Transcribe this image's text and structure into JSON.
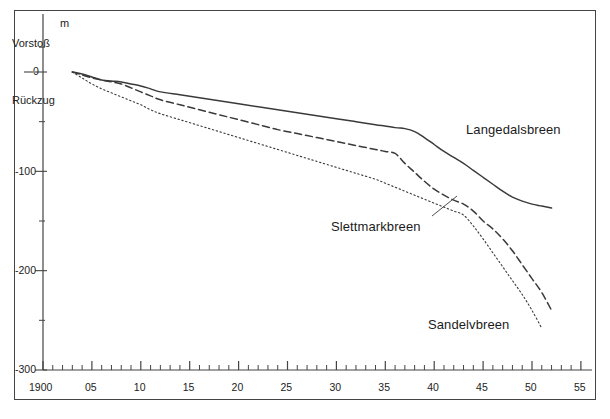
{
  "figure": {
    "unit_label": "m",
    "advance_label": "Vorstoß",
    "retreat_label": "Rückzug",
    "background_color": "#ffffff",
    "line_color": "#3a3a3a",
    "frame_color": "#444444"
  },
  "chart_data": {
    "type": "line",
    "title": "",
    "subtitle": "",
    "xlabel": "",
    "ylabel": "m",
    "axis_notes": {
      "positive_direction": "Vorstoß",
      "negative_direction": "Rückzug"
    },
    "xlim": [
      1900,
      1955
    ],
    "ylim": [
      -300,
      30
    ],
    "grid": false,
    "legend": "inline-labels",
    "x_tick_labels": [
      "1900",
      "05",
      "10",
      "15",
      "20",
      "25",
      "30",
      "35",
      "40",
      "45",
      "50",
      "55"
    ],
    "x_tick_values": [
      1900,
      1905,
      1910,
      1915,
      1920,
      1925,
      1930,
      1935,
      1940,
      1945,
      1950,
      1955
    ],
    "x_minor_tick_interval": 1,
    "y_tick_labels": [
      "0",
      "-100",
      "-200",
      "-300"
    ],
    "y_tick_values": [
      0,
      -100,
      -200,
      -300
    ],
    "y_minor_tick_values": [
      -50,
      -150,
      -250,
      25
    ],
    "series": [
      {
        "name": "Langedalsbreen",
        "style": "solid",
        "label_position": {
          "x": 466,
          "y": 122
        },
        "x": [
          1903,
          1904,
          1905,
          1906,
          1907,
          1908,
          1909,
          1910,
          1911,
          1912,
          1914,
          1916,
          1918,
          1920,
          1922,
          1924,
          1926,
          1928,
          1930,
          1932,
          1934,
          1936,
          1937,
          1938,
          1939,
          1940,
          1941,
          1942,
          1943,
          1944,
          1945,
          1946,
          1947,
          1948,
          1949,
          1950,
          1951,
          1952
        ],
        "y": [
          0,
          -2,
          -5,
          -8,
          -9,
          -10,
          -12,
          -14,
          -17,
          -20,
          -23,
          -26,
          -29,
          -32,
          -35,
          -38,
          -41,
          -44,
          -47,
          -50,
          -53,
          -56,
          -57,
          -60,
          -66,
          -73,
          -80,
          -86,
          -92,
          -99,
          -106,
          -113,
          -120,
          -126,
          -130,
          -133,
          -135,
          -137
        ]
      },
      {
        "name": "Slettmarkbreen",
        "style": "dashed",
        "label_position": {
          "x": 331,
          "y": 219
        },
        "leader_line": {
          "x1": 432,
          "y1": 216,
          "x2": 457,
          "y2": 196
        },
        "x": [
          1903,
          1904,
          1905,
          1906,
          1907,
          1908,
          1909,
          1910,
          1911,
          1912,
          1914,
          1916,
          1918,
          1920,
          1922,
          1924,
          1926,
          1928,
          1930,
          1932,
          1934,
          1935,
          1936,
          1937,
          1938,
          1939,
          1940,
          1941,
          1942,
          1943,
          1944,
          1945,
          1946,
          1947,
          1948,
          1949,
          1950,
          1951,
          1952
        ],
        "y": [
          0,
          -3,
          -6,
          -8,
          -10,
          -12,
          -16,
          -20,
          -24,
          -28,
          -33,
          -38,
          -43,
          -48,
          -53,
          -58,
          -62,
          -66,
          -70,
          -74,
          -78,
          -80,
          -82,
          -92,
          -101,
          -110,
          -118,
          -124,
          -129,
          -133,
          -140,
          -150,
          -158,
          -168,
          -180,
          -194,
          -208,
          -222,
          -240
        ]
      },
      {
        "name": "Sandelvbreen",
        "style": "dotted",
        "label_position": {
          "x": 428,
          "y": 317
        },
        "x": [
          1903,
          1904,
          1905,
          1906,
          1907,
          1908,
          1909,
          1910,
          1911,
          1912,
          1914,
          1916,
          1918,
          1920,
          1922,
          1924,
          1926,
          1928,
          1930,
          1932,
          1934,
          1935,
          1936,
          1937,
          1938,
          1939,
          1940,
          1941,
          1942,
          1943,
          1944,
          1945,
          1946,
          1947,
          1948,
          1949,
          1950,
          1951
        ],
        "y": [
          0,
          -6,
          -12,
          -17,
          -21,
          -25,
          -29,
          -33,
          -38,
          -42,
          -48,
          -54,
          -60,
          -66,
          -72,
          -78,
          -84,
          -90,
          -96,
          -102,
          -108,
          -112,
          -116,
          -120,
          -124,
          -128,
          -132,
          -136,
          -140,
          -144,
          -155,
          -168,
          -182,
          -196,
          -210,
          -224,
          -240,
          -258
        ]
      }
    ]
  },
  "axes_pixels": {
    "x0_year": 1900,
    "x0_px": 43,
    "px_per_year": 9.78,
    "y0_value": 0,
    "y0_px": 72,
    "px_per_unit": 0.9933
  }
}
